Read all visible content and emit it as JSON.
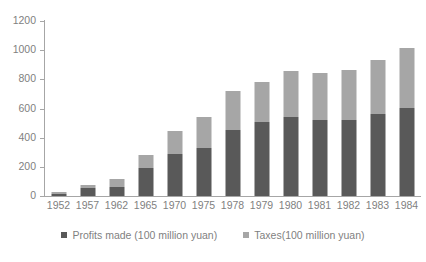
{
  "chart_data": {
    "type": "bar",
    "subtype": "stacked-bar",
    "title": "",
    "xlabel": "",
    "ylabel": "",
    "ylim": [
      0,
      1200
    ],
    "y_ticks": [
      0,
      200,
      400,
      600,
      800,
      1000,
      1200
    ],
    "grid": false,
    "legend_position": "bottom",
    "categories": [
      "1952",
      "1957",
      "1962",
      "1965",
      "1970",
      "1975",
      "1978",
      "1979",
      "1980",
      "1981",
      "1982",
      "1983",
      "1984"
    ],
    "series": [
      {
        "name": "Profits made (100 million yuan)",
        "color": "#595959",
        "values": [
          16,
          53,
          62,
          190,
          290,
          330,
          455,
          510,
          545,
          520,
          520,
          565,
          605
        ]
      },
      {
        "name": "Taxes(100 million yuan)",
        "color": "#a6a6a6",
        "values": [
          9,
          21,
          52,
          90,
          155,
          215,
          265,
          275,
          310,
          325,
          345,
          365,
          410
        ]
      }
    ],
    "totals": [
      25,
      74,
      114,
      280,
      445,
      545,
      720,
      785,
      855,
      845,
      865,
      930,
      1015
    ]
  },
  "axes": {
    "y_tick_labels": [
      "1200",
      "1000",
      "800",
      "600",
      "400",
      "200",
      "0"
    ],
    "x_tick_labels": [
      "1952",
      "1957",
      "1962",
      "1965",
      "1970",
      "1975",
      "1978",
      "1979",
      "1980",
      "1981",
      "1982",
      "1983",
      "1984"
    ]
  },
  "legend": {
    "items": [
      {
        "label": "Profits made (100 million yuan)",
        "color": "#595959"
      },
      {
        "label": "Taxes(100 million yuan)",
        "color": "#a6a6a6"
      }
    ]
  },
  "colors": {
    "profits": "#595959",
    "taxes": "#a6a6a6",
    "axis": "#a6a6a6",
    "text": "#7f7f7f",
    "background": "#ffffff"
  }
}
